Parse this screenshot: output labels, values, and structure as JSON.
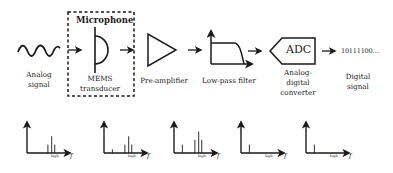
{
  "diagram": {
    "stages": [
      {
        "id": "analog-signal",
        "label_line1": "Analog",
        "label_line2": "signal",
        "icon": "sine-wave-icon"
      },
      {
        "id": "microphone",
        "group_title": "Microphone",
        "label_line1": "MEMS",
        "label_line2": "transducer",
        "icon": "microphone-transducer-icon"
      },
      {
        "id": "pre-amplifier",
        "label_line1": "Pre-amplifier",
        "icon": "amplifier-triangle-icon"
      },
      {
        "id": "low-pass-filter",
        "label_line1": "Low-pass filter",
        "icon": "lowpass-filter-icon"
      },
      {
        "id": "adc",
        "block_text": "ADC",
        "label_line1": "Analog-",
        "label_line2": "digital",
        "label_line3": "converter",
        "icon": "adc-pentagon-icon"
      },
      {
        "id": "digital-signal",
        "output_text": "10111100....",
        "label_line1": "Digital",
        "label_line2": "signal"
      }
    ],
    "spectra": [
      {
        "axis_label": "f",
        "marker": "high",
        "bars": [
          {
            "x": 0.55,
            "h": 0.35
          },
          {
            "x": 0.65,
            "h": 0.7
          },
          {
            "x": 0.73,
            "h": 0.35
          }
        ]
      },
      {
        "axis_label": "f",
        "marker": "high",
        "bars": [
          {
            "x": 0.22,
            "h": 0.15
          },
          {
            "x": 0.55,
            "h": 0.35
          },
          {
            "x": 0.65,
            "h": 0.7
          },
          {
            "x": 0.73,
            "h": 0.35
          }
        ]
      },
      {
        "axis_label": "f",
        "marker": "high",
        "bars": [
          {
            "x": 0.22,
            "h": 0.35
          },
          {
            "x": 0.55,
            "h": 0.55
          },
          {
            "x": 0.65,
            "h": 0.9
          },
          {
            "x": 0.73,
            "h": 0.55
          }
        ]
      },
      {
        "axis_label": "f",
        "marker": "high",
        "bars": [
          {
            "x": 0.22,
            "h": 0.35
          }
        ]
      },
      {
        "axis_label": "f",
        "marker": "high",
        "bars": [
          {
            "x": 0.22,
            "h": 0.35
          }
        ]
      }
    ]
  }
}
